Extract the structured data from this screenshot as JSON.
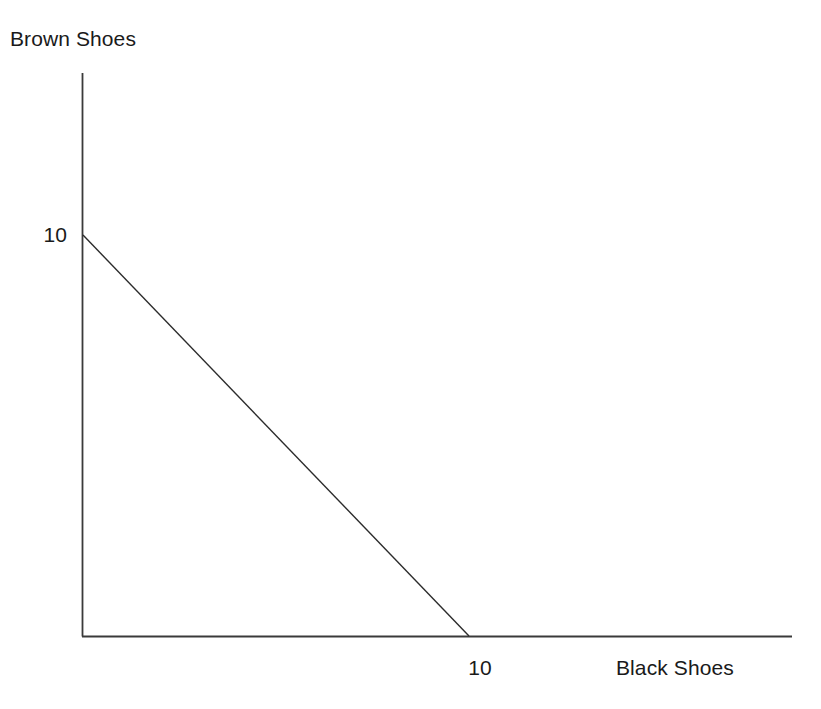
{
  "figure": {
    "width": 821,
    "height": 709,
    "background": "#ffffff",
    "ink_color": "#1a1a1a",
    "axis_color": "#3a3a3a"
  },
  "axes": {
    "origin_px": {
      "x": 82,
      "y": 636
    },
    "y_axis_top_px": 73,
    "x_axis_right_px": 792,
    "y_label": "Brown Shoes",
    "x_label": "Black Shoes",
    "y_tick_label": "10",
    "x_tick_label": "10",
    "y_tick_px": 235,
    "x_tick_px": 469
  },
  "chart_data": {
    "type": "line",
    "title": "",
    "subtitle": "",
    "xlabel": "Black Shoes",
    "ylabel": "Brown Shoes",
    "xlim": [
      0,
      16.8
    ],
    "ylim": [
      0,
      14.0
    ],
    "xticks": [
      10
    ],
    "xticklabels": [
      "10"
    ],
    "yticks": [
      10
    ],
    "yticklabels": [
      "10"
    ],
    "grid": false,
    "legend": false,
    "legend_position": "none",
    "series": [
      {
        "name": "Production possibilities frontier",
        "x": [
          0,
          10
        ],
        "y": [
          10,
          0
        ],
        "linewidth": 1.4,
        "color": "#2b2b2b",
        "style": "solid"
      }
    ],
    "annotations": []
  }
}
